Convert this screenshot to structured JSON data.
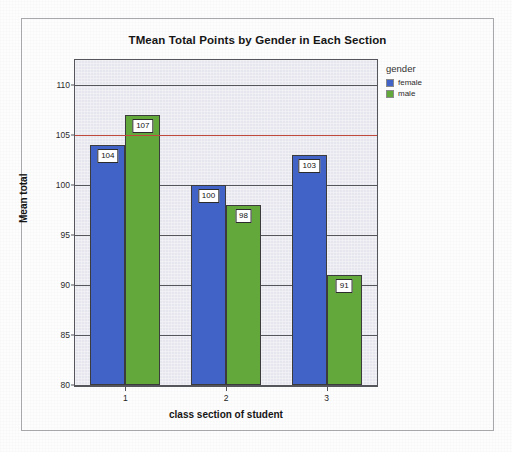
{
  "chart_data": {
    "type": "bar",
    "title": "TMean Total Points by Gender in Each Section",
    "xlabel": "class section of student",
    "ylabel": "Mean total",
    "categories": [
      "1",
      "2",
      "3"
    ],
    "series": [
      {
        "name": "female",
        "color": "#4163c8",
        "values": [
          104,
          100,
          103
        ]
      },
      {
        "name": "male",
        "color": "#62a83a",
        "values": [
          107,
          98,
          91
        ]
      }
    ],
    "ylim": [
      80,
      112.5
    ],
    "yticks": [
      80,
      85,
      90,
      95,
      100,
      105,
      110
    ],
    "ytick_labels": [
      "80",
      "85",
      "90",
      "95",
      "100",
      "105",
      "110"
    ],
    "grid": true,
    "grid_axis": "y",
    "legend": {
      "title": "gender",
      "position": "right-top",
      "entries": [
        {
          "label": "female",
          "color": "#4163c8"
        },
        {
          "label": "male",
          "color": "#62a83a"
        }
      ]
    },
    "annotations": [
      {
        "type": "hline",
        "value": 105,
        "color": "#c04a3c",
        "label": ""
      }
    ],
    "data_labels": [
      {
        "category": "1",
        "series": "female",
        "value": "104"
      },
      {
        "category": "1",
        "series": "male",
        "value": "107"
      },
      {
        "category": "2",
        "series": "female",
        "value": "100"
      },
      {
        "category": "2",
        "series": "male",
        "value": "98"
      },
      {
        "category": "3",
        "series": "female",
        "value": "103"
      },
      {
        "category": "3",
        "series": "male",
        "value": "91"
      }
    ],
    "plot_background": "#e6e6ee"
  }
}
